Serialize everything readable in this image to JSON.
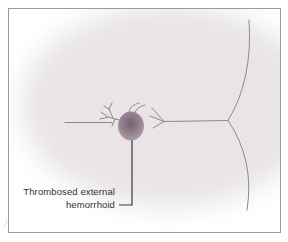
{
  "figure": {
    "label": {
      "line1": "Thrombosed external",
      "line2": "hemorrhoid"
    },
    "colors": {
      "frame_border": "#9a9a9a",
      "skin_tint": "#e9e5e7",
      "line": "#8f8a85",
      "leader": "#3a3a3a",
      "text": "#333333",
      "hemorrhoid_center": "#75606e",
      "hemorrhoid_mid": "#93808d",
      "hemorrhoid_edge": "#b2a2ab"
    }
  }
}
